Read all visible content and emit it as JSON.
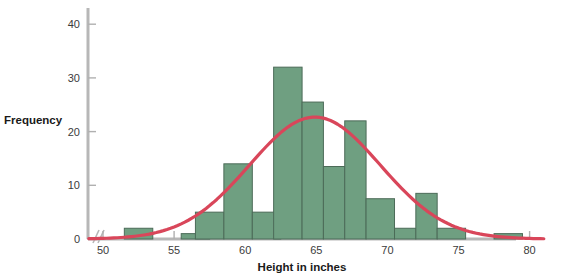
{
  "chart_data": {
    "type": "bar",
    "title": "",
    "subtitle": "",
    "xlabel": "Height in inches",
    "ylabel": "Frequency",
    "xlim": [
      49,
      81
    ],
    "ylim": [
      0,
      44
    ],
    "xticks": [
      50,
      55,
      60,
      65,
      70,
      75,
      80
    ],
    "yticks": [
      0,
      10,
      20,
      30,
      40
    ],
    "xtick_labels": [
      "50",
      "55",
      "60",
      "65",
      "70",
      "75",
      "80"
    ],
    "ytick_labels": [
      "0",
      "10",
      "20",
      "30",
      "40"
    ],
    "grid": false,
    "legend": null,
    "axis_break": true,
    "bin_width": 2,
    "bin_starts": [
      51.5,
      53.5,
      55.5,
      57.5,
      59.5,
      61.5,
      63.5,
      65.5,
      67.5,
      69.5,
      71.5,
      73.5,
      77.5
    ],
    "categories": [
      "51.5-53.5",
      "53.5-55.5",
      "55.5-57.5",
      "57.5-59.5",
      "59.5-61.5",
      "61.5-63.5",
      "63.5-65.5",
      "65.5-67.5",
      "67.5-69.5",
      "69.5-71.5",
      "71.5-73.5",
      "73.5-75.5",
      "77.5-79.5"
    ],
    "values": [
      2,
      0,
      1,
      5,
      14,
      5,
      32,
      25.5,
      13.5,
      22,
      7.5,
      8.5,
      1
    ],
    "bars": [
      {
        "start": 51.5,
        "end": 53.5,
        "value": 2
      },
      {
        "start": 55.5,
        "end": 57.5,
        "value": 1
      },
      {
        "start": 56.5,
        "end": 58.5,
        "value": 5
      },
      {
        "start": 58.5,
        "end": 60.5,
        "value": 14
      },
      {
        "start": 60.5,
        "end": 62.5,
        "value": 5
      },
      {
        "start": 62.0,
        "end": 64.0,
        "value": 32
      },
      {
        "start": 64.0,
        "end": 65.5,
        "value": 25.5
      },
      {
        "start": 65.5,
        "end": 67.0,
        "value": 13.5
      },
      {
        "start": 67.0,
        "end": 68.5,
        "value": 22
      },
      {
        "start": 68.5,
        "end": 70.5,
        "value": 7.5
      },
      {
        "start": 70.5,
        "end": 72.0,
        "value": 2
      },
      {
        "start": 72.0,
        "end": 73.5,
        "value": 8.5
      },
      {
        "start": 73.5,
        "end": 75.5,
        "value": 2
      },
      {
        "start": 77.5,
        "end": 79.5,
        "value": 1
      }
    ],
    "overlay_curve": {
      "name": "normal-curve",
      "type": "line",
      "mean": 64.9,
      "peak_value": 22.7,
      "std_dev": 4.6,
      "color": "#d9465a"
    },
    "colors": {
      "bar_fill": "#6f9f81",
      "bar_stroke": "#4c6b58",
      "curve": "#d9465a",
      "axis": "#b0b0b0",
      "text": "#2b2b2b",
      "background": "#ffffff"
    }
  }
}
